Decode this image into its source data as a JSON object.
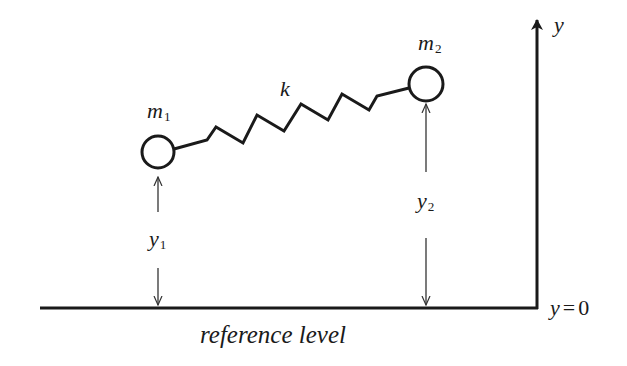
{
  "diagram": {
    "colors": {
      "stroke": "#1a1a1a",
      "background": "#ffffff"
    },
    "masses": [
      {
        "id": "m1",
        "label": "m",
        "subscript": "1",
        "cx": 158,
        "cy": 152,
        "r": 16
      },
      {
        "id": "m2",
        "label": "m",
        "subscript": "2",
        "cx": 426,
        "cy": 84,
        "r": 17
      }
    ],
    "spring": {
      "label": "k",
      "points": "174,149 207,140 216,127 243,143 257,115 284,131 301,104 328,120 342,94 369,110 377,96 409,88"
    },
    "heights": [
      {
        "id": "y1",
        "label": "y",
        "subscript": "1",
        "x": 158,
        "arrow_up": {
          "from": 212,
          "to": 177
        },
        "arrow_down": {
          "from": 268,
          "to": 305
        }
      },
      {
        "id": "y2",
        "label": "y",
        "subscript": "2",
        "x": 426,
        "arrow_up": {
          "from": 172,
          "to": 104
        },
        "arrow_down": {
          "from": 238,
          "to": 305
        }
      }
    ],
    "axis": {
      "label": "y",
      "x": 537,
      "top": 18,
      "bottom": 308
    },
    "baseline": {
      "y": 308,
      "x_start": 40,
      "x_end": 538,
      "zero_label_var": "y",
      "zero_label_eq": "=",
      "zero_label_val": "0"
    },
    "reference_label": "reference level"
  }
}
